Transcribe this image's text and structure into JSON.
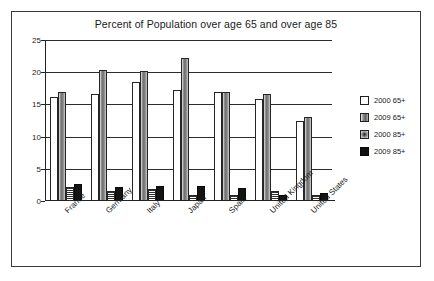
{
  "chart_data": {
    "type": "bar",
    "title": "Percent of Population over age 65 and over age 85",
    "xlabel": "",
    "ylabel": "",
    "ylim": [
      0,
      25
    ],
    "yticks": [
      0,
      5,
      10,
      15,
      20,
      25
    ],
    "grid": true,
    "legend_position": "right",
    "categories": [
      "France",
      "Germany",
      "Italy",
      "Japan",
      "Spain",
      "United Kingdom",
      "United States"
    ],
    "series": [
      {
        "name": "2000 65+",
        "color": "#ffffff",
        "values": [
          16.1,
          16.6,
          18.5,
          17.2,
          17.0,
          15.8,
          12.5
        ]
      },
      {
        "name": "2009 65+",
        "color": "#6f6f6f",
        "values": [
          16.9,
          20.3,
          20.2,
          22.2,
          17.0,
          16.6,
          13.0
        ]
      },
      {
        "name": "2000 85+",
        "color": "#9c9c9c",
        "values": [
          2.2,
          1.6,
          1.8,
          1.0,
          1.0,
          1.5,
          1.0
        ]
      },
      {
        "name": "2009 85+",
        "color": "#141414",
        "values": [
          2.6,
          2.1,
          2.3,
          2.3,
          2.0,
          0.9,
          1.2
        ]
      }
    ]
  }
}
